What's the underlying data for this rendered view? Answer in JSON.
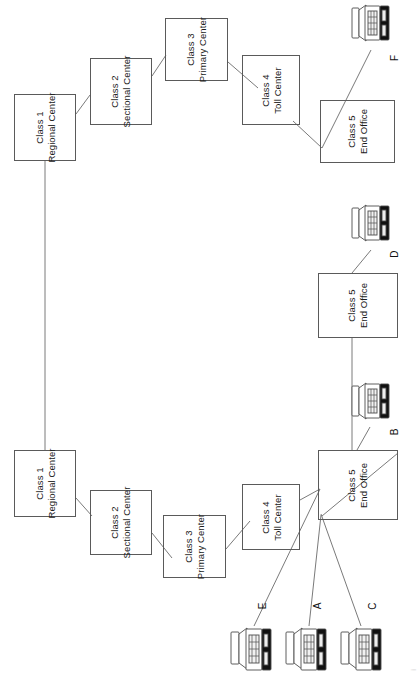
{
  "diagram": {
    "orientation": "rotated-90-ccw",
    "canvas": {
      "width": 419,
      "height": 675
    },
    "stroke_color": "#5a5a5a",
    "line_color": "#7a7a7a",
    "text_color": "#1a1a1a",
    "background": "#ffffff",
    "caption": "i",
    "nodes": [
      {
        "id": "rc-top",
        "line1": "Class 1",
        "line2": "Regional Center",
        "x": 14,
        "y": 94,
        "w": 62,
        "h": 67
      },
      {
        "id": "sc-top",
        "line1": "Class 2",
        "line2": "Sectional Center",
        "x": 90,
        "y": 58,
        "w": 62,
        "h": 67
      },
      {
        "id": "pc-top",
        "line1": "Class 3",
        "line2": "Primary Center",
        "x": 165,
        "y": 18,
        "w": 63,
        "h": 63
      },
      {
        "id": "tc-top",
        "line1": "Class 4",
        "line2": "Toll Center",
        "x": 242,
        "y": 55,
        "w": 58,
        "h": 70
      },
      {
        "id": "eo-f",
        "line1": "Class 5",
        "line2": "End Office",
        "x": 320,
        "y": 100,
        "w": 75,
        "h": 63
      },
      {
        "id": "eo-d",
        "line1": "Class 5",
        "line2": "End Office",
        "x": 318,
        "y": 273,
        "w": 80,
        "h": 65
      },
      {
        "id": "eo-main",
        "line1": "Class 5",
        "line2": "End Office",
        "x": 318,
        "y": 450,
        "w": 80,
        "h": 70
      },
      {
        "id": "tc-bot",
        "line1": "Class 4",
        "line2": "Toll Center",
        "x": 242,
        "y": 484,
        "w": 58,
        "h": 66
      },
      {
        "id": "pc-bot",
        "line1": "Class 3",
        "line2": "Primary Center",
        "x": 163,
        "y": 515,
        "w": 63,
        "h": 63
      },
      {
        "id": "sc-bot",
        "line1": "Class 2",
        "line2": "Sectional Center",
        "x": 90,
        "y": 490,
        "w": 62,
        "h": 65
      },
      {
        "id": "rc-bot",
        "line1": "Class 1",
        "line2": "Regional Center",
        "x": 14,
        "y": 450,
        "w": 62,
        "h": 67
      }
    ],
    "phones": [
      {
        "id": "F",
        "label": "F",
        "x": 348,
        "y": 3,
        "lx": 394,
        "ly": 60
      },
      {
        "id": "D",
        "label": "D",
        "x": 348,
        "y": 203,
        "lx": 394,
        "ly": 248
      },
      {
        "id": "B",
        "label": "B",
        "x": 348,
        "y": 381,
        "lx": 394,
        "ly": 426
      },
      {
        "id": "E",
        "label": "E",
        "x": 228,
        "y": 617,
        "lx": 263,
        "ly": 600
      },
      {
        "id": "A",
        "label": "A",
        "x": 283,
        "y": 617,
        "lx": 318,
        "ly": 600
      },
      {
        "id": "C",
        "label": "C",
        "x": 338,
        "y": 617,
        "lx": 373,
        "ly": 600
      }
    ],
    "links": [
      {
        "from": "rc-top",
        "to": "sc-top",
        "path": "M76,112 L90,96"
      },
      {
        "from": "sc-top",
        "to": "pc-top",
        "path": "M152,74 L166,54"
      },
      {
        "from": "pc-top",
        "to": "tc-top",
        "path": "M228,60 L258,90"
      },
      {
        "from": "tc-top",
        "to": "eo-f",
        "path": "M295,120 L322,148"
      },
      {
        "from": "eo-f",
        "to": "F",
        "path": "M322,148 L372,48"
      },
      {
        "from": "rc-top",
        "to": "rc-bot",
        "path": "M45,161 L45,450"
      },
      {
        "from": "rc-bot",
        "to": "sc-bot",
        "path": "M76,497 L92,514"
      },
      {
        "from": "sc-bot",
        "to": "pc-bot",
        "path": "M152,530 L170,556"
      },
      {
        "from": "pc-bot",
        "to": "tc-bot",
        "path": "M226,548 L252,520"
      },
      {
        "from": "tc-bot",
        "to": "eo-main",
        "path": "M300,498 L320,487"
      },
      {
        "from": "eo-main",
        "to": "eo-d",
        "path": "M352,450 L352,338"
      },
      {
        "from": "eo-main",
        "to": "B",
        "path": "M356,450 L370,424"
      },
      {
        "from": "eo-d",
        "to": "D",
        "path": "M352,273 L372,248"
      },
      {
        "from": "eo-main",
        "to": "E",
        "path": "M320,487 L255,625"
      },
      {
        "from": "eo-main",
        "to": "A",
        "path": "M322,512 L310,625"
      },
      {
        "from": "eo-main",
        "to": "C",
        "path": "M322,512 L362,625"
      },
      {
        "from": "eo-main",
        "to": "eo-cross",
        "path": "M398,455 L320,515"
      }
    ]
  }
}
